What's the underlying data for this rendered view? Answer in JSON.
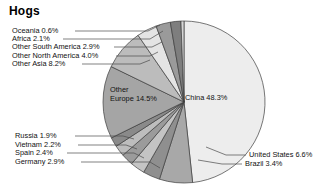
{
  "title": "Hogs",
  "chart_data": {
    "type": "pie",
    "title": "Hogs",
    "unit": "%",
    "legend_position": "callout-labels",
    "grid": false,
    "start_angle_deg": 0,
    "direction": "clockwise",
    "categories": [
      "China",
      "United States",
      "Brazil",
      "Germany",
      "Spain",
      "Vietnam",
      "Russia",
      "Other Europe",
      "Other Asia",
      "Other North America",
      "Other South America",
      "Africa",
      "Oceania"
    ],
    "values": [
      48.3,
      6.6,
      3.4,
      2.9,
      2.4,
      2.2,
      1.9,
      14.5,
      8.2,
      4.0,
      2.9,
      2.1,
      0.6
    ],
    "slices": [
      {
        "label": "China 48.3%",
        "name": "China",
        "value": 48.3,
        "color": "#ededed"
      },
      {
        "label": "United States 6.6%",
        "name": "United States",
        "value": 6.6,
        "color": "#a8a8a8"
      },
      {
        "label": "Brazil 3.4%",
        "name": "Brazil",
        "value": 3.4,
        "color": "#8f8f8f"
      },
      {
        "label": "Germany 2.9%",
        "name": "Germany",
        "value": 2.9,
        "color": "#c4c4c4"
      },
      {
        "label": "Spain 2.4%",
        "name": "Spain",
        "value": 2.4,
        "color": "#9b9b9b"
      },
      {
        "label": "Vietnam 2.2%",
        "name": "Vietnam",
        "value": 2.2,
        "color": "#bdbdbd"
      },
      {
        "label": "Russia 1.9%",
        "name": "Russia",
        "value": 1.9,
        "color": "#8a8a8a"
      },
      {
        "label": "Other Europe 14.5%",
        "name": "Other Europe",
        "value": 14.5,
        "color": "#a5a5a5"
      },
      {
        "label": "Other Asia 8.2%",
        "name": "Other Asia",
        "value": 8.2,
        "color": "#bcbcbc"
      },
      {
        "label": "Other North America 4.0%",
        "name": "Other North America",
        "value": 4.0,
        "color": "#e4e4e4"
      },
      {
        "label": "Other South America 2.9%",
        "name": "Other South America",
        "value": 2.9,
        "color": "#9a9a9a"
      },
      {
        "label": "Africa 2.1%",
        "name": "Africa",
        "value": 2.1,
        "color": "#7e7e7e"
      },
      {
        "label": "Oceania 0.6%",
        "name": "Oceania",
        "value": 0.6,
        "color": "#d6d6d6"
      }
    ]
  },
  "labels": {
    "oceania": "Oceania 0.6%",
    "africa": "Africa 2.1%",
    "other_south_america": "Other South America 2.9%",
    "other_north_america": "Other North America 4.0%",
    "other_asia": "Other Asia 8.2%",
    "russia": "Russia 1.9%",
    "vietnam": "Vietnam 2.2%",
    "spain": "Spain 2.4%",
    "germany": "Germany 2.9%",
    "united_states": "United States 6.6%",
    "brazil": "Brazil 3.4%",
    "china": "China 48.3%",
    "other_europe_line1": "Other",
    "other_europe_line2": "Europe 14.5%"
  }
}
